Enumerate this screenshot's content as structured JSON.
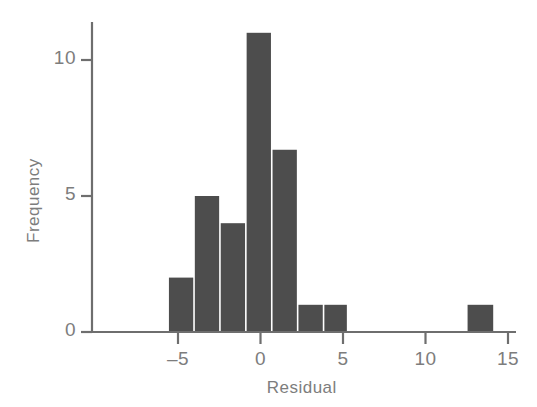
{
  "chart_data": {
    "type": "bar",
    "title": "",
    "subtitle": "",
    "xlabel": "Residual",
    "ylabel": "Frequency",
    "xlim": [
      -8.5,
      16.0
    ],
    "ylim": [
      0,
      11.6
    ],
    "grid": false,
    "legend": null,
    "xticks": [
      -5,
      0,
      5,
      10,
      15
    ],
    "xtick_labels": [
      "–5",
      "0",
      "5",
      "10",
      "15"
    ],
    "yticks": [
      0,
      5,
      10
    ],
    "ytick_labels": [
      "0",
      "5",
      "10"
    ],
    "bar_color": "#4d4d4d",
    "axis_color": "#6e6e6e",
    "text_color": "#7d7d7d",
    "background_color": "#ffffff",
    "bin_width": 1.57,
    "bins": [
      {
        "x0": -5.55,
        "x1": -3.98,
        "value": 2
      },
      {
        "x0": -3.98,
        "x1": -2.41,
        "value": 5
      },
      {
        "x0": -2.41,
        "x1": -0.84,
        "value": 4
      },
      {
        "x0": -0.84,
        "x1": 0.73,
        "value": 11
      },
      {
        "x0": 0.73,
        "x1": 2.3,
        "value": 6.7
      },
      {
        "x0": 2.3,
        "x1": 3.87,
        "value": 1
      },
      {
        "x0": 3.87,
        "x1": 5.33,
        "value": 1
      },
      {
        "x0": 12.55,
        "x1": 14.2,
        "value": 1
      }
    ],
    "categories": [
      "-5.6 to -4.0",
      "-4.0 to -2.4",
      "-2.4 to -0.8",
      "-0.8 to 0.7",
      "0.7 to 2.3",
      "2.3 to 3.9",
      "3.9 to 5.3",
      "12.6 to 14.2"
    ],
    "values": [
      2,
      5,
      4,
      11,
      6.7,
      1,
      1,
      1
    ]
  }
}
